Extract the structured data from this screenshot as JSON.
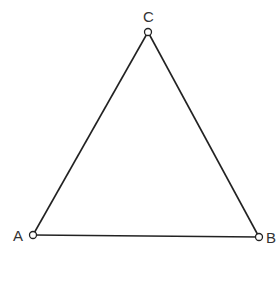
{
  "diagram": {
    "stroke_color": "#222222",
    "points": [
      {
        "label": "A",
        "x": 33,
        "y": 235
      },
      {
        "label": "B",
        "x": 259,
        "y": 237
      },
      {
        "label": "C",
        "x": 148,
        "y": 32
      }
    ],
    "segments": [
      {
        "from": "A",
        "to": "B"
      },
      {
        "from": "B",
        "to": "C"
      },
      {
        "from": "C",
        "to": "A"
      }
    ]
  }
}
